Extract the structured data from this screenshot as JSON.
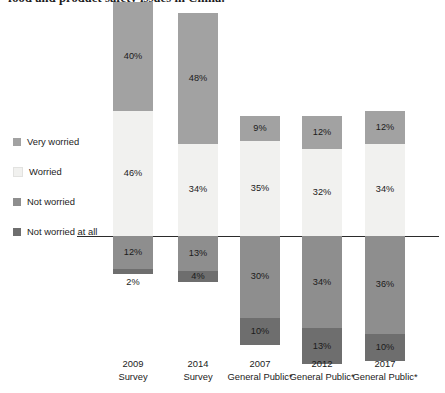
{
  "headline": "food and product safety issues in China.",
  "legend": {
    "position": "left",
    "items": [
      {
        "label": "Very worried",
        "color": "#a2a2a2",
        "key": "very_worried"
      },
      {
        "label": "Worried",
        "color": "#f1f1ef",
        "key": "worried"
      },
      {
        "label": "Not worried",
        "color": "#8e8e8e",
        "key": "not_worried"
      },
      {
        "label": "Not worried at all",
        "color": "#6e6e6e",
        "key": "not_worried_at_all"
      }
    ]
  },
  "chart_data": {
    "type": "bar",
    "subtype": "diverging-stacked-bar",
    "title": "food and product safety issues in China.",
    "xlabel": "",
    "ylabel": "",
    "grid": false,
    "legend_position": "left",
    "baseline_value": 0,
    "value_suffix": "%",
    "categories": [
      "2009 Survey",
      "2014 Survey",
      "2007 General Public*",
      "2012 General Public*",
      "2017 General Public*"
    ],
    "category_lines": [
      [
        "2009",
        "Survey"
      ],
      [
        "2014",
        "Survey"
      ],
      [
        "2007",
        "General Public*"
      ],
      [
        "2012",
        "General Public*"
      ],
      [
        "2017",
        "General Public*"
      ]
    ],
    "series": [
      {
        "name": "Very worried",
        "direction": "up",
        "color": "#a2a2a2",
        "values": [
          40,
          48,
          9,
          12,
          12
        ]
      },
      {
        "name": "Worried",
        "direction": "up",
        "color": "#f1f1ef",
        "values": [
          46,
          34,
          35,
          32,
          34
        ]
      },
      {
        "name": "Not worried",
        "direction": "down",
        "color": "#8e8e8e",
        "values": [
          12,
          13,
          30,
          34,
          36
        ]
      },
      {
        "name": "Not worried at all",
        "direction": "down",
        "color": "#6e6e6e",
        "values": [
          2,
          4,
          10,
          13,
          10
        ]
      }
    ]
  },
  "bars": [
    {
      "category_line1": "2009",
      "category_line2": "Survey",
      "segments": [
        {
          "name": "Very worried",
          "label": "40%",
          "value": 40,
          "color": "#a2a2a2",
          "label_inside": true
        },
        {
          "name": "Worried",
          "label": "46%",
          "value": 46,
          "color": "#f1f1ef",
          "label_inside": true
        },
        {
          "name": "Not worried",
          "label": "12%",
          "value": 12,
          "color": "#8e8e8e",
          "label_inside": true
        },
        {
          "name": "Not worried at all",
          "label": "2%",
          "value": 2,
          "color": "#6e6e6e",
          "label_inside": false
        }
      ]
    },
    {
      "category_line1": "2014",
      "category_line2": "Survey",
      "segments": [
        {
          "name": "Very worried",
          "label": "48%",
          "value": 48,
          "color": "#a2a2a2",
          "label_inside": true
        },
        {
          "name": "Worried",
          "label": "34%",
          "value": 34,
          "color": "#f1f1ef",
          "label_inside": true
        },
        {
          "name": "Not worried",
          "label": "13%",
          "value": 13,
          "color": "#8e8e8e",
          "label_inside": true
        },
        {
          "name": "Not worried at all",
          "label": "4%",
          "value": 4,
          "color": "#6e6e6e",
          "label_inside": true
        }
      ]
    },
    {
      "category_line1": "2007",
      "category_line2": "General Public*",
      "segments": [
        {
          "name": "Very worried",
          "label": "9%",
          "value": 9,
          "color": "#a2a2a2",
          "label_inside": true
        },
        {
          "name": "Worried",
          "label": "35%",
          "value": 35,
          "color": "#f1f1ef",
          "label_inside": true
        },
        {
          "name": "Not worried",
          "label": "30%",
          "value": 30,
          "color": "#8e8e8e",
          "label_inside": true
        },
        {
          "name": "Not worried at all",
          "label": "10%",
          "value": 10,
          "color": "#6e6e6e",
          "label_inside": true
        }
      ]
    },
    {
      "category_line1": "2012",
      "category_line2": "General Public*",
      "segments": [
        {
          "name": "Very worried",
          "label": "12%",
          "value": 12,
          "color": "#a2a2a2",
          "label_inside": true
        },
        {
          "name": "Worried",
          "label": "32%",
          "value": 32,
          "color": "#f1f1ef",
          "label_inside": true
        },
        {
          "name": "Not worried",
          "label": "34%",
          "value": 34,
          "color": "#8e8e8e",
          "label_inside": true
        },
        {
          "name": "Not worried at all",
          "label": "13%",
          "value": 13,
          "color": "#6e6e6e",
          "label_inside": true
        }
      ]
    },
    {
      "category_line1": "2017",
      "category_line2": "General Public*",
      "segments": [
        {
          "name": "Very worried",
          "label": "12%",
          "value": 12,
          "color": "#a2a2a2",
          "label_inside": true
        },
        {
          "name": "Worried",
          "label": "34%",
          "value": 34,
          "color": "#f1f1ef",
          "label_inside": true
        },
        {
          "name": "Not worried",
          "label": "36%",
          "value": 36,
          "color": "#8e8e8e",
          "label_inside": true
        },
        {
          "name": "Not worried at all",
          "label": "10%",
          "value": 10,
          "color": "#6e6e6e",
          "label_inside": true
        }
      ]
    }
  ],
  "layout": {
    "baseline_y": 236,
    "px_per_unit": 2.72,
    "bar_width": 40,
    "bar_x": [
      113,
      178,
      240,
      302,
      365
    ]
  }
}
